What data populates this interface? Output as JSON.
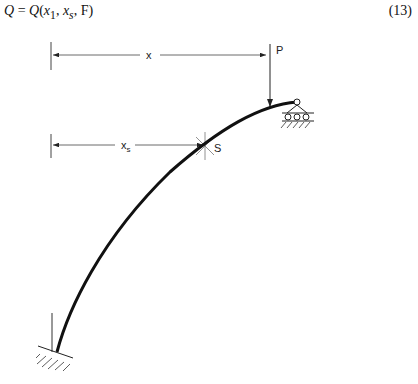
{
  "equation": {
    "text": "Q = Q(x1, xs, F)",
    "lhs": "Q",
    "rhs_func": "Q",
    "args": [
      "x1",
      "xs",
      "F"
    ],
    "number": "(13)"
  },
  "diagram": {
    "dimension_x_label": "x",
    "dimension_xs_label": "x",
    "dimension_xs_subscript": "s",
    "load_label": "P",
    "section_label": "S",
    "left_support": "fixed-support",
    "right_support": "roller-support"
  }
}
